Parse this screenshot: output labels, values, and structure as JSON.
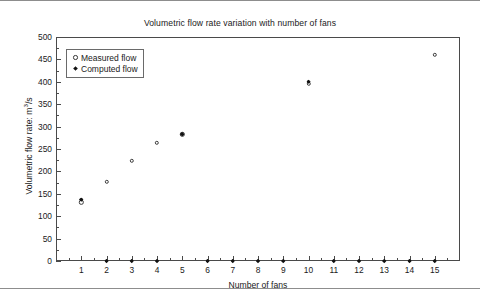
{
  "chart_data": {
    "type": "scatter",
    "title": "Volumetric flow rate variation with number of fans",
    "xlabel": "Number of fans",
    "ylabel": "Volumetric flow rate: m",
    "ylabel_sup": "3",
    "ylabel_suffix": "/s",
    "xlim": [
      0,
      16
    ],
    "ylim": [
      0,
      500
    ],
    "ytick_step": 50,
    "grid": false,
    "legend_position": "top-left",
    "yticks": [
      "0",
      "50",
      "100",
      "150",
      "200",
      "250",
      "300",
      "350",
      "400",
      "450",
      "500"
    ],
    "xticks": [
      "1",
      "2",
      "3",
      "4",
      "5",
      "6",
      "7",
      "8",
      "9",
      "10",
      "11",
      "12",
      "13",
      "14",
      "15"
    ],
    "series": [
      {
        "name": "Measured flow",
        "marker": "open-circle",
        "color": "#3a3a3a",
        "x": [
          1,
          2,
          3,
          4,
          5,
          10,
          15
        ],
        "values": [
          131,
          177,
          224,
          264,
          283,
          396,
          460
        ]
      },
      {
        "name": "Computed flow",
        "marker": "filled-diamond",
        "color": "#111111",
        "x": [
          1,
          2,
          3,
          4,
          5,
          6,
          7,
          8,
          9,
          10,
          11,
          12,
          13,
          14,
          15
        ],
        "values": [
          137,
          0,
          0,
          0,
          283,
          0,
          0,
          0,
          0,
          400,
          0,
          0,
          0,
          0,
          0
        ]
      }
    ]
  }
}
